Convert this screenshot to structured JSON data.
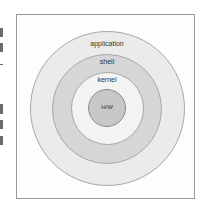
{
  "diagram": {
    "type": "concentric-layers",
    "layers": [
      {
        "label": "application",
        "fill": "#ebebeb"
      },
      {
        "label": "shell",
        "fill": "#d6d6d6"
      },
      {
        "label": "kernel",
        "fill": "#f3f3f3"
      },
      {
        "label": "H/W",
        "fill": "#c8c8c8"
      }
    ]
  }
}
